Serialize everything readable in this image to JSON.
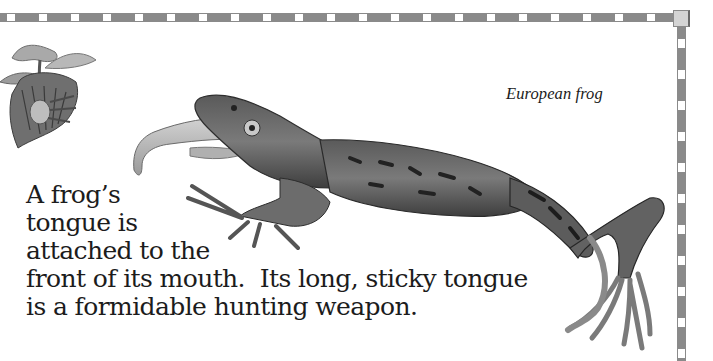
{
  "page": {
    "caption": "European frog",
    "body_lines": [
      "A frog’s",
      "tongue is",
      "attached to the",
      "front of its mouth.  Its long, sticky tongue",
      "is a formidable hunting weapon."
    ]
  },
  "illustrations": {
    "flower": "flower-illustration",
    "frog": "european-frog-illustration"
  },
  "border": {
    "color": "#8a8a8a",
    "square_color": "#ffffff"
  }
}
